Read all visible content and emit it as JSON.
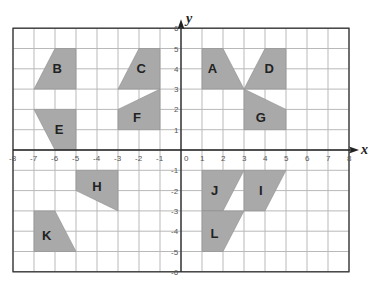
{
  "diagram": {
    "type": "coordinate-plane",
    "x_axis": {
      "label": "x",
      "min": -8,
      "max": 8
    },
    "y_axis": {
      "label": "y",
      "min": -6,
      "max": 6
    },
    "origin_label": "0",
    "x_ticks": [
      "-8",
      "-7",
      "-6",
      "-5",
      "-4",
      "-3",
      "-2",
      "-1",
      "1",
      "2",
      "3",
      "4",
      "5",
      "6",
      "7",
      "8"
    ],
    "y_ticks": [
      "6",
      "5",
      "4",
      "3",
      "2",
      "1",
      "-1",
      "-2",
      "-3",
      "-4",
      "-5",
      "-6"
    ],
    "fill_color": "#a9a9a9",
    "shapes": [
      {
        "label": "A",
        "points": [
          [
            1,
            5
          ],
          [
            2,
            5
          ],
          [
            3,
            3
          ],
          [
            1,
            3
          ]
        ],
        "label_at": [
          1.5,
          4
        ]
      },
      {
        "label": "B",
        "points": [
          [
            -6,
            5
          ],
          [
            -5,
            5
          ],
          [
            -5,
            3
          ],
          [
            -7,
            3
          ]
        ],
        "label_at": [
          -5.9,
          4
        ]
      },
      {
        "label": "C",
        "points": [
          [
            -2,
            5
          ],
          [
            -1,
            5
          ],
          [
            -1,
            3
          ],
          [
            -3,
            3
          ]
        ],
        "label_at": [
          -1.9,
          4
        ]
      },
      {
        "label": "D",
        "points": [
          [
            4,
            5
          ],
          [
            5,
            5
          ],
          [
            5,
            3
          ],
          [
            3,
            3
          ]
        ],
        "label_at": [
          4.2,
          4
        ]
      },
      {
        "label": "E",
        "points": [
          [
            -7,
            2
          ],
          [
            -5,
            2
          ],
          [
            -5,
            0
          ],
          [
            -6,
            0
          ]
        ],
        "label_at": [
          -5.8,
          1
        ]
      },
      {
        "label": "F",
        "points": [
          [
            -3,
            2
          ],
          [
            -1,
            3
          ],
          [
            -1,
            1
          ],
          [
            -3,
            1
          ]
        ],
        "label_at": [
          -2.1,
          1.6
        ]
      },
      {
        "label": "G",
        "points": [
          [
            3,
            3
          ],
          [
            5,
            2
          ],
          [
            5,
            1
          ],
          [
            3,
            1
          ]
        ],
        "label_at": [
          3.8,
          1.6
        ]
      },
      {
        "label": "H",
        "points": [
          [
            -5,
            -1
          ],
          [
            -3,
            -1
          ],
          [
            -3,
            -3
          ],
          [
            -5,
            -2
          ]
        ],
        "label_at": [
          -4,
          -1.8
        ]
      },
      {
        "label": "I",
        "points": [
          [
            3,
            -1
          ],
          [
            5,
            -1
          ],
          [
            4,
            -3
          ],
          [
            3,
            -3
          ]
        ],
        "label_at": [
          3.8,
          -2
        ]
      },
      {
        "label": "J",
        "points": [
          [
            1,
            -1
          ],
          [
            3,
            -1
          ],
          [
            2,
            -3
          ],
          [
            1,
            -3
          ]
        ],
        "label_at": [
          1.6,
          -2
        ]
      },
      {
        "label": "K",
        "points": [
          [
            -7,
            -3
          ],
          [
            -6,
            -3
          ],
          [
            -5,
            -5
          ],
          [
            -7,
            -5
          ]
        ],
        "label_at": [
          -6.4,
          -4.2
        ]
      },
      {
        "label": "L",
        "points": [
          [
            1,
            -3
          ],
          [
            3,
            -3
          ],
          [
            2,
            -5
          ],
          [
            1,
            -5
          ]
        ],
        "label_at": [
          1.6,
          -4.1
        ]
      }
    ]
  }
}
